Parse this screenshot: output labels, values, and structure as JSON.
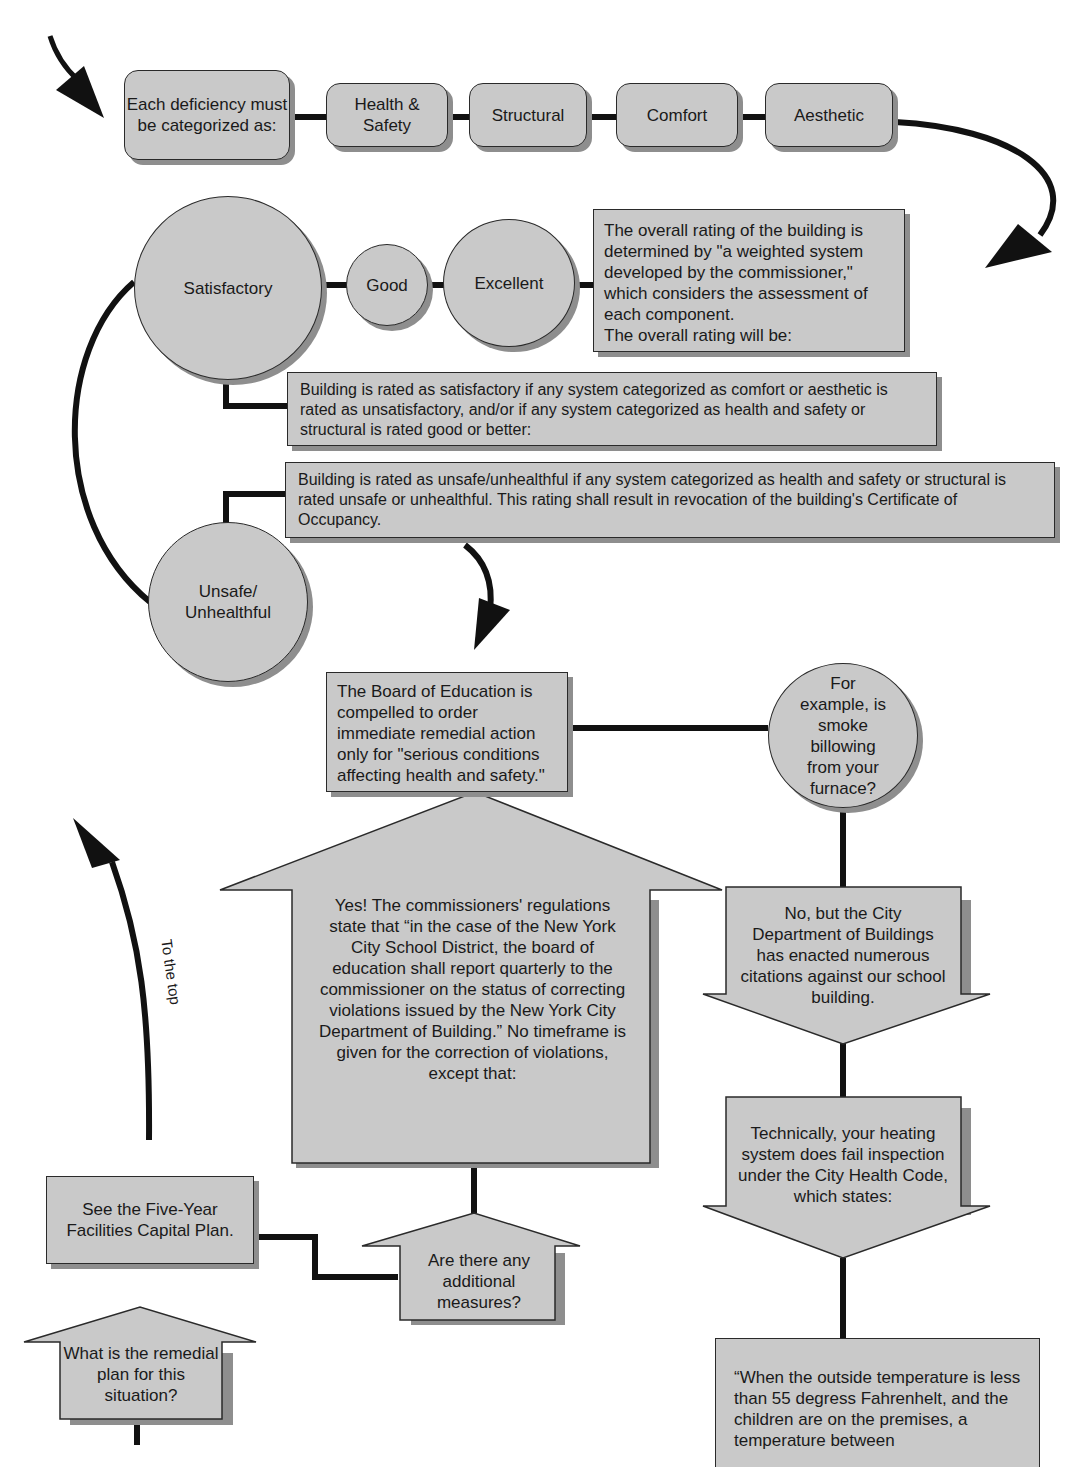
{
  "categorize": {
    "intro": "Each deficiency must be categorized as:",
    "categories": [
      "Health & Safety",
      "Structural",
      "Comfort",
      "Aesthetic"
    ]
  },
  "ratings": {
    "satisfactory": "Satisfactory",
    "good": "Good",
    "excellent": "Excellent",
    "unsafe": "Unsafe/ Unhealthful",
    "overall_note": "The overall rating of the building is determined by \"a weighted system developed by the commissioner,\" which considers the assessment of each component.",
    "overall_will_be": "The overall rating will be:",
    "satisfactory_rule": "Building is rated as satisfactory if any system categorized as comfort or aesthetic is rated as unsatisfactory, and/or if any system categorized as health and safety or structural is rated good or better:",
    "unsafe_rule": "Building is rated as unsafe/unhealthful if any system categorized as health and safety or structural is rated unsafe or unhealthful. This rating shall result in revocation of the building's Certificate of Occupancy."
  },
  "board": {
    "text": "The Board of Education is compelled to order immediate remedial action only for \"serious conditions affecting health and safety.\"",
    "example_question": "For example, is smoke billowing from your furnace?"
  },
  "yes_answer": "Yes! The commissioners' regulations state that “in the case of the New York City School District, the board of education shall report quarterly to the commissioner on the status of correcting violations issued by the New York City Department of Building.” No timeframe is given for the correction of violations, except that:",
  "no_answer": "No, but the City Department of Buildings has enacted numerous citations against our school building.",
  "technically": "Technically, your heating system does fail inspection under the City Health Code, which states:",
  "health_code_quote": "“When the outside temperature is less than 55 degress Fahrenhelt, and the children are on the premises, a temperature between",
  "additional_measures": "Are there any additional measures?",
  "five_year_plan": "See the Five-Year Facilities Capital Plan.",
  "remedial_plan": "What is the remedial plan for this situation?",
  "to_the_top": "To the top",
  "colors": {
    "fill": "#c9c9c9",
    "stroke": "#2a2a2a",
    "shadow": "#8e8e8e",
    "connector": "#111111"
  }
}
